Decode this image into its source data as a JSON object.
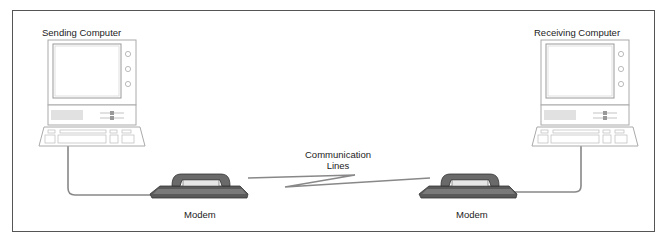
{
  "diagram": {
    "sending_computer": {
      "label": "Sending Computer",
      "icon": "computer-icon"
    },
    "receiving_computer": {
      "label": "Receiving Computer",
      "icon": "computer-icon"
    },
    "left_modem": {
      "label": "Modem",
      "icon": "telephone-modem-icon"
    },
    "right_modem": {
      "label": "Modem",
      "icon": "telephone-modem-icon"
    },
    "communication_lines": {
      "line1": "Communication",
      "line2": "Lines"
    },
    "colors": {
      "cable": "#888888",
      "modem": "#6a6a6a",
      "modem_dark": "#3a3a3a",
      "outline": "#b0b0b0",
      "border": "#555555"
    }
  }
}
